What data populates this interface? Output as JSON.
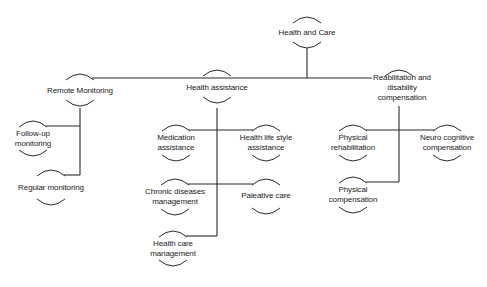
{
  "diagram": {
    "type": "tree",
    "root": {
      "id": "health-and-care",
      "label": "Health and Care",
      "x": 307,
      "y": 28
    },
    "branches": [
      {
        "id": "remote-monitoring",
        "label": "Remote Monitoring",
        "x": 80,
        "y": 92,
        "children": [
          {
            "id": "follow-up-monitoring",
            "label_lines": [
              "Follow-up",
              "monitoring"
            ],
            "x": 33,
            "y": 136
          },
          {
            "id": "regular-monitoring",
            "label": "Regular monitoring",
            "x": 51,
            "y": 188
          }
        ]
      },
      {
        "id": "health-assistance",
        "label": "Health assistance",
        "x": 217,
        "y": 88,
        "children": [
          {
            "id": "medication-assistance",
            "label_lines": [
              "Medication",
              "assistance"
            ],
            "x": 176,
            "y": 142
          },
          {
            "id": "health-life-style-assistance",
            "label_lines": [
              "Health life style",
              "assistance"
            ],
            "x": 266,
            "y": 142
          },
          {
            "id": "chronic-diseases-management",
            "label_lines": [
              "Chronic diseases",
              "management"
            ],
            "x": 175,
            "y": 196
          },
          {
            "id": "paleative-care",
            "label": "Paleative care",
            "x": 266,
            "y": 196
          },
          {
            "id": "health-care-management",
            "label_lines": [
              "Health care",
              "management"
            ],
            "x": 173,
            "y": 248
          }
        ]
      },
      {
        "id": "reabilitation-and-disability-compensation",
        "label_lines": [
          "Reabilitation and",
          "disability",
          "compensation"
        ],
        "x": 399,
        "y": 78,
        "children": [
          {
            "id": "physical-rehabilitation",
            "label_lines": [
              "Physical",
              "rehabilitation"
            ],
            "x": 353,
            "y": 142
          },
          {
            "id": "neuro-cognitive-compensation",
            "label_lines": [
              "Neuro cognitive",
              "compensation"
            ],
            "x": 447,
            "y": 142
          },
          {
            "id": "physical-compensation",
            "label_lines": [
              "Physical",
              "compensation"
            ],
            "x": 353,
            "y": 194
          }
        ]
      }
    ],
    "colors": {
      "line": "#2a2a2a",
      "text": "#1a1a1a",
      "background": "#ffffff"
    }
  },
  "labels": {
    "root": "Health and Care",
    "remote": "Remote Monitoring",
    "followup_1": "Follow-up",
    "followup_2": "monitoring",
    "regular": "Regular monitoring",
    "assist": "Health assistance",
    "med_1": "Medication",
    "med_2": "assistance",
    "life_1": "Health life style",
    "life_2": "assistance",
    "chronic_1": "Chronic diseases",
    "chronic_2": "management",
    "paleative": "Paleative care",
    "hcm_1": "Health care",
    "hcm_2": "management",
    "rehab_1": "Reabilitation and",
    "rehab_2": "disability",
    "rehab_3": "compensation",
    "phys_rehab_1": "Physical",
    "phys_rehab_2": "rehabilitation",
    "neuro_1": "Neuro cognitive",
    "neuro_2": "compensation",
    "phys_comp_1": "Physical",
    "phys_comp_2": "compensation"
  }
}
